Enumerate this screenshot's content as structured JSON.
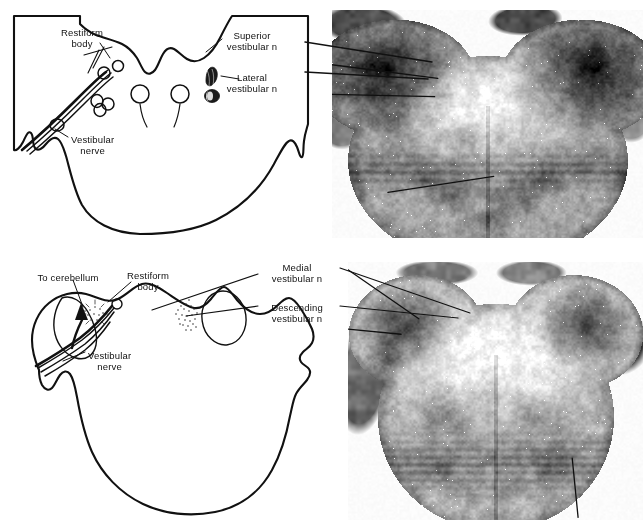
{
  "figure": {
    "type": "anatomical-diagram-with-photomicrographs",
    "background_color": "#ffffff",
    "ink_color": "#111111",
    "panel_count": 4
  },
  "top_margin_mark": {
    "text": "",
    "visible": false
  },
  "upper_row": {
    "name": "upper-section",
    "diagram": {
      "name": "upper-schematic-drawing",
      "description": "Outline drawing of pontine-level brainstem cross-section, open at upper left",
      "labels": [
        {
          "id": "restiform-body-upper",
          "line1": "Restiform",
          "line2": "body",
          "x": 82,
          "y": 27,
          "align": "center"
        },
        {
          "id": "vestibular-nerve-upper",
          "line1": "Vestibular",
          "line2": "nerve",
          "x": 71,
          "y": 134,
          "align": "left"
        },
        {
          "id": "superior-vestibular-n",
          "line1": "Superior",
          "line2": "vestibular n",
          "x": 252,
          "y": 30,
          "align": "center"
        },
        {
          "id": "lateral-vestibular-n",
          "line1": "Lateral",
          "line2": "vestibular n",
          "x": 252,
          "y": 72,
          "align": "center"
        }
      ]
    },
    "photo": {
      "name": "upper-photomicrograph",
      "description": "Weigert-stained transverse histological section of pons at the level of the superior and lateral vestibular nuclei",
      "x": 332,
      "y": 10,
      "width": 311,
      "height": 228,
      "leader_lines": [
        {
          "target": "superior-vestibular-n"
        },
        {
          "target": "lateral-vestibular-n"
        }
      ]
    }
  },
  "lower_row": {
    "name": "lower-section",
    "diagram": {
      "name": "lower-schematic-drawing",
      "description": "Outline drawing of medullary-level brainstem cross-section with cerebellar peduncle",
      "labels": [
        {
          "id": "to-cerebellum",
          "line1": "To cerebellum",
          "line2": "",
          "x": 68,
          "y": 272,
          "align": "center"
        },
        {
          "id": "restiform-body-lower",
          "line1": "Restiform",
          "line2": "body",
          "x": 148,
          "y": 270,
          "align": "center"
        },
        {
          "id": "vestibular-nerve-lower",
          "line1": "Vestibular",
          "line2": "nerve",
          "x": 88,
          "y": 350,
          "align": "left"
        },
        {
          "id": "medial-vestibular-n",
          "line1": "Medial",
          "line2": "vestibular n",
          "x": 297,
          "y": 262,
          "align": "center"
        },
        {
          "id": "descending-vestibular-n",
          "line1": "Descending",
          "line2": "vestibular n",
          "x": 297,
          "y": 302,
          "align": "center"
        }
      ]
    },
    "photo": {
      "name": "lower-photomicrograph",
      "description": "Weigert-stained transverse histological section of medulla at the level of the medial and descending vestibular nuclei",
      "x": 348,
      "y": 262,
      "width": 295,
      "height": 258,
      "leader_lines": [
        {
          "target": "medial-vestibular-n"
        },
        {
          "target": "descending-vestibular-n"
        }
      ]
    }
  }
}
